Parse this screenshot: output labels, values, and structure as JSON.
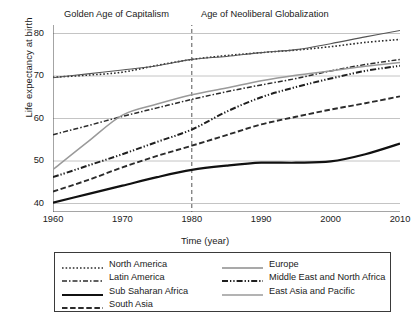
{
  "chart_data": {
    "type": "line",
    "title": "",
    "xlabel": "Time (year)",
    "ylabel": "Life expectancy at birth",
    "xlim": [
      1960,
      2010
    ],
    "ylim": [
      38,
      82
    ],
    "xticks": [
      1960,
      1970,
      1980,
      1990,
      2000,
      2010
    ],
    "yticks": [
      40,
      50,
      60,
      70,
      80
    ],
    "grid": "horizontal",
    "legend_position": "below-plot",
    "x": [
      1960,
      1965,
      1970,
      1975,
      1980,
      1985,
      1990,
      1995,
      2000,
      2005,
      2010
    ],
    "series": [
      {
        "name": "North America",
        "style": "dotted",
        "color": "#2b2b2b",
        "width": 1.6,
        "values": [
          69.7,
          70.2,
          70.9,
          72.5,
          73.9,
          74.8,
          75.5,
          76.1,
          76.9,
          77.9,
          78.6
        ]
      },
      {
        "name": "Latin America",
        "style": "dash-dot",
        "color": "#2b2b2b",
        "width": 1.5,
        "values": [
          56.2,
          58.3,
          60.5,
          62.5,
          64.5,
          66.3,
          67.9,
          69.4,
          71.2,
          72.7,
          73.9
        ]
      },
      {
        "name": "Sub Saharan Africa",
        "style": "solid",
        "color": "#111111",
        "width": 2.2,
        "values": [
          40.2,
          42.2,
          44.2,
          46.2,
          47.9,
          48.9,
          49.6,
          49.6,
          49.9,
          51.6,
          54.1
        ]
      },
      {
        "name": "South Asia",
        "style": "dashed",
        "color": "#2b2b2b",
        "width": 1.9,
        "values": [
          42.8,
          45.5,
          48.5,
          51.2,
          53.6,
          56.1,
          58.6,
          60.4,
          62.1,
          63.6,
          65.2
        ]
      },
      {
        "name": "Europe",
        "style": "solid",
        "color": "#555555",
        "width": 1.1,
        "values": [
          69.6,
          70.5,
          71.4,
          72.4,
          73.9,
          74.6,
          75.5,
          76.2,
          77.6,
          79.2,
          80.7
        ]
      },
      {
        "name": "Middle East and North Africa",
        "style": "dash-dot-dot",
        "color": "#1f1f1f",
        "width": 2.0,
        "values": [
          46.2,
          48.9,
          51.6,
          54.5,
          57.4,
          61.6,
          65.0,
          67.4,
          69.4,
          71.2,
          72.4
        ]
      },
      {
        "name": "East Asia and Pacific",
        "style": "solid",
        "color": "#9a9a9a",
        "width": 1.5,
        "values": [
          48.0,
          54.5,
          60.8,
          63.4,
          65.6,
          67.2,
          68.9,
          70.2,
          71.2,
          72.3,
          73.2
        ]
      }
    ],
    "annotations": [
      {
        "text": "Golden Age of Capitalism",
        "x_range": [
          1960,
          1980
        ]
      },
      {
        "text": "Age of Neoliberal Globalization",
        "x_range": [
          1980,
          2010
        ]
      }
    ],
    "reference_lines": [
      {
        "orientation": "vertical",
        "x": 1980,
        "style": "dashed",
        "color": "#555555"
      }
    ]
  },
  "legend": {
    "columns": [
      {
        "items": [
          "North America",
          "Latin America",
          "Sub Saharan Africa",
          "South Asia"
        ]
      },
      {
        "items": [
          "Europe",
          "Middle East and North Africa",
          "East Asia and Pacific"
        ]
      }
    ]
  }
}
